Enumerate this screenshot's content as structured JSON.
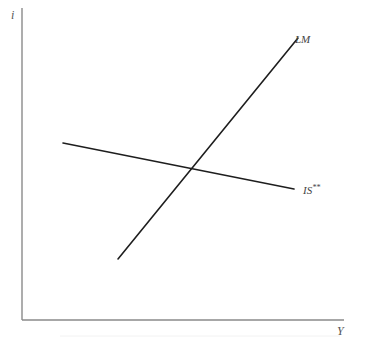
{
  "diagram": {
    "type": "IS-LM model diagram",
    "axes": {
      "y_label": "i",
      "x_label": "Y"
    },
    "curves": [
      {
        "id": "lm",
        "label": "LM",
        "slope": "upward",
        "color": "#1e1e1e"
      },
      {
        "id": "is",
        "label_base": "IS",
        "label_superscript": "**",
        "label": "IS**",
        "slope": "downward (shallow)",
        "color": "#1e1e1e"
      }
    ],
    "intersection": "equilibrium point where LM crosses IS**"
  }
}
